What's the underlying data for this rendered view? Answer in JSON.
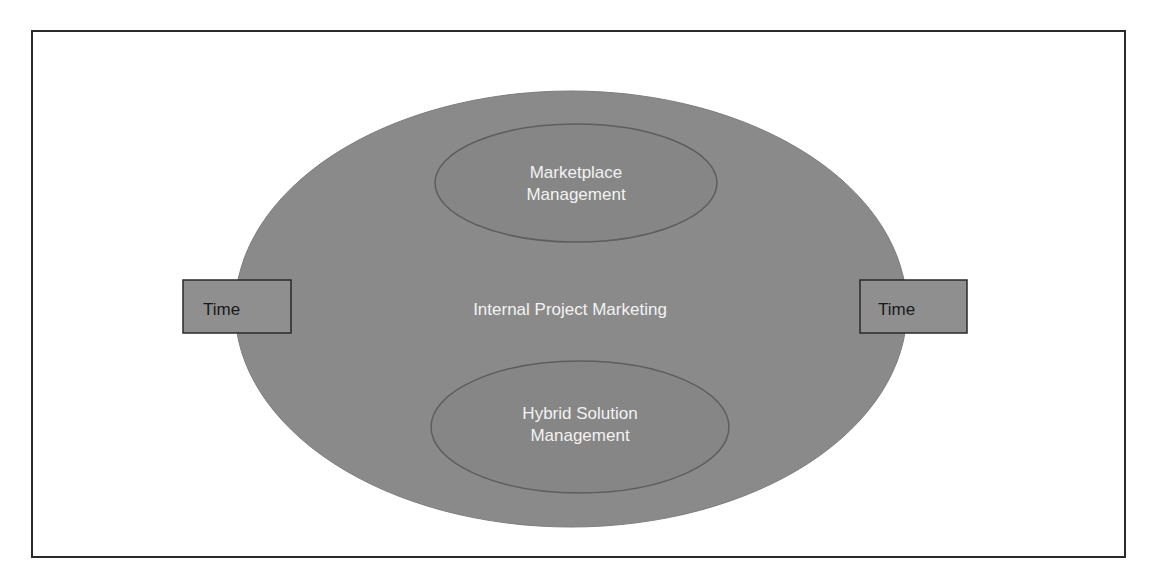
{
  "diagram": {
    "outer": {
      "label": "Internal Project Marketing",
      "fill": "#8a8a8a",
      "stroke": "#7a7a7a"
    },
    "inner_top": {
      "line1": "Marketplace",
      "line2": "Management",
      "fill": "#858585",
      "stroke": "#5a5a5a"
    },
    "inner_bottom": {
      "line1": "Hybrid Solution",
      "line2": "Management",
      "fill": "#858585",
      "stroke": "#5a5a5a"
    },
    "time_left": {
      "label": "Time",
      "fill": "#8f8f8f",
      "stroke": "#2a2a2a"
    },
    "time_right": {
      "label": "Time",
      "fill": "#8f8f8f",
      "stroke": "#2a2a2a"
    }
  }
}
